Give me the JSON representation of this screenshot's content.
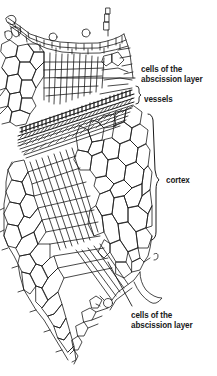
{
  "figure": {
    "type": "botanical-cross-section",
    "ink_color": "#1a1a1a",
    "background_color": "#ffffff"
  },
  "labels": {
    "abscission_top": {
      "line1": "cells of the",
      "line2": "abscission layer"
    },
    "vessels": {
      "text": "vessels"
    },
    "cortex": {
      "text": "cortex"
    },
    "abscission_bottom": {
      "line1": "cells of the",
      "line2": "abscission layer"
    }
  }
}
